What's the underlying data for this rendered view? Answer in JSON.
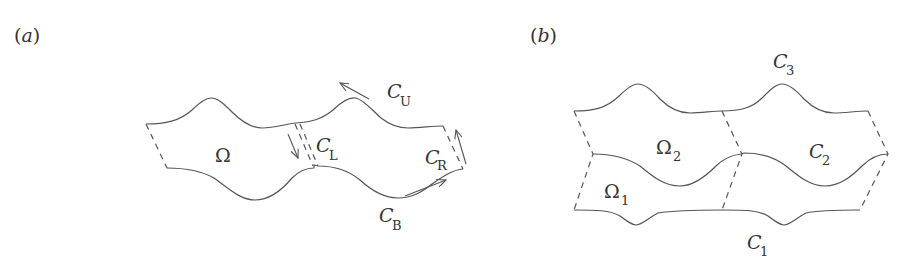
{
  "panels": [
    {
      "id": "a",
      "tag_open": "(",
      "tag_letter": "a",
      "tag_close": ")",
      "region_label": "Ω",
      "curves": [
        {
          "name": "C",
          "sub": "U"
        },
        {
          "name": "C",
          "sub": "L"
        },
        {
          "name": "C",
          "sub": "R"
        },
        {
          "name": "C",
          "sub": "B"
        }
      ]
    },
    {
      "id": "b",
      "tag_open": "(",
      "tag_letter": "b",
      "tag_close": ")",
      "regions": [
        {
          "name": "Ω",
          "sub": "1"
        },
        {
          "name": "Ω",
          "sub": "2"
        }
      ],
      "curves": [
        {
          "name": "C",
          "sub": "1"
        },
        {
          "name": "C",
          "sub": "2"
        },
        {
          "name": "C",
          "sub": "3"
        }
      ]
    }
  ],
  "colors": {
    "stroke": "#555555",
    "text": "#333333",
    "background": "#ffffff"
  }
}
